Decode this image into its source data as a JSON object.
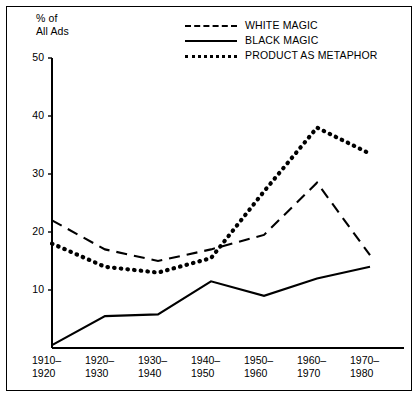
{
  "chart_data": {
    "type": "line",
    "title": "",
    "subtitle": "",
    "ylabel": "% of\nAll Ads",
    "xlabel": "",
    "ylim": [
      0,
      50
    ],
    "yticks": [
      10,
      20,
      30,
      40,
      50
    ],
    "ytick_labels": [
      "10",
      "20",
      "30",
      "40",
      "50"
    ],
    "grid": false,
    "legend_position": "top-right",
    "categories": [
      "1910–\n1920",
      "1920–\n1930",
      "1930–\n1940",
      "1940–\n1950",
      "1950–\n1960",
      "1960–\n1970",
      "1970–\n1980"
    ],
    "category_labels_flat": [
      "1910–1920",
      "1920–1930",
      "1930–1940",
      "1940–1950",
      "1950–1960",
      "1960–1970",
      "1970–1980"
    ],
    "series": [
      {
        "name": "WHITE MAGIC",
        "style": "dashed",
        "color": "#000000",
        "values": [
          22,
          17,
          15,
          17,
          19.5,
          28.5,
          16
        ]
      },
      {
        "name": "BLACK MAGIC",
        "style": "solid",
        "color": "#000000",
        "values": [
          0.5,
          5.5,
          5.8,
          11.5,
          9,
          12,
          14
        ]
      },
      {
        "name": "PRODUCT AS METAPHOR",
        "style": "dotted",
        "color": "#000000",
        "values": [
          18,
          14,
          13,
          15.5,
          27,
          38,
          33.5
        ]
      }
    ]
  },
  "axis": {
    "y_title_line1": "% of",
    "y_title_line2": "All Ads"
  },
  "legend": {
    "entries": [
      {
        "label": "WHITE MAGIC",
        "style": "dashed"
      },
      {
        "label": "BLACK MAGIC",
        "style": "solid"
      },
      {
        "label": "PRODUCT AS METAPHOR",
        "style": "dotted"
      }
    ]
  },
  "colors": {
    "ink": "#000000",
    "paper": "#ffffff"
  }
}
